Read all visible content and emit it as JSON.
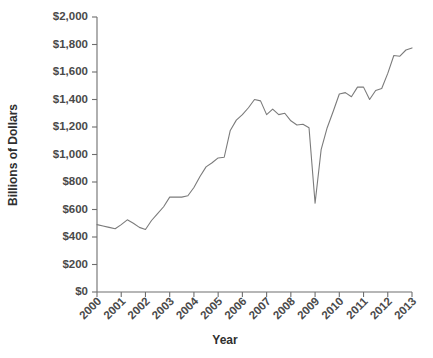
{
  "chart_data": {
    "type": "line",
    "title": "",
    "xlabel": "Year",
    "ylabel": "Billions of Dollars",
    "xlim": [
      2000,
      2013
    ],
    "ylim": [
      0,
      2000
    ],
    "grid": false,
    "legend": false,
    "line_color": "#7b7b7b",
    "background_color": "#ffffff",
    "axis_color": "#6e6e6e",
    "x_tick_labels": [
      "2000",
      "2001",
      "2002",
      "2003",
      "2004",
      "2005",
      "2006",
      "2007",
      "2008",
      "2009",
      "2010",
      "2011",
      "2012",
      "2013"
    ],
    "x_tick_values": [
      2000,
      2001,
      2002,
      2003,
      2004,
      2005,
      2006,
      2007,
      2008,
      2009,
      2010,
      2011,
      2012,
      2013
    ],
    "y_tick_labels": [
      "$0",
      "$200",
      "$400",
      "$600",
      "$800",
      "$1,000",
      "$1,200",
      "$1,400",
      "$1,600",
      "$1,800",
      "$2,000"
    ],
    "y_tick_values": [
      0,
      200,
      400,
      600,
      800,
      1000,
      1200,
      1400,
      1600,
      1800,
      2000
    ],
    "series": [
      {
        "name": "Billions of Dollars",
        "x": [
          2000.0,
          2000.25,
          2000.5,
          2000.75,
          2001.0,
          2001.25,
          2001.5,
          2001.75,
          2002.0,
          2002.25,
          2002.5,
          2002.75,
          2003.0,
          2003.25,
          2003.5,
          2003.75,
          2004.0,
          2004.25,
          2004.5,
          2004.75,
          2005.0,
          2005.25,
          2005.5,
          2005.75,
          2006.0,
          2006.25,
          2006.5,
          2006.75,
          2007.0,
          2007.25,
          2007.5,
          2007.75,
          2008.0,
          2008.25,
          2008.5,
          2008.75,
          2009.0,
          2009.25,
          2009.5,
          2009.75,
          2010.0,
          2010.25,
          2010.5,
          2010.75,
          2011.0,
          2011.25,
          2011.5,
          2011.75,
          2012.0,
          2012.25,
          2012.5,
          2012.75,
          2013.0
        ],
        "values": [
          490,
          480,
          470,
          460,
          490,
          525,
          500,
          470,
          455,
          520,
          570,
          620,
          690,
          690,
          690,
          700,
          760,
          840,
          910,
          940,
          975,
          980,
          1175,
          1250,
          1290,
          1340,
          1400,
          1390,
          1290,
          1330,
          1290,
          1300,
          1245,
          1215,
          1220,
          1195,
          645,
          1035,
          1195,
          1315,
          1440,
          1450,
          1420,
          1490,
          1490,
          1400,
          1465,
          1480,
          1590,
          1720,
          1715,
          1760,
          1775
        ]
      }
    ]
  },
  "axis_titles": {
    "x": "Year",
    "y": "Billions of Dollars"
  }
}
